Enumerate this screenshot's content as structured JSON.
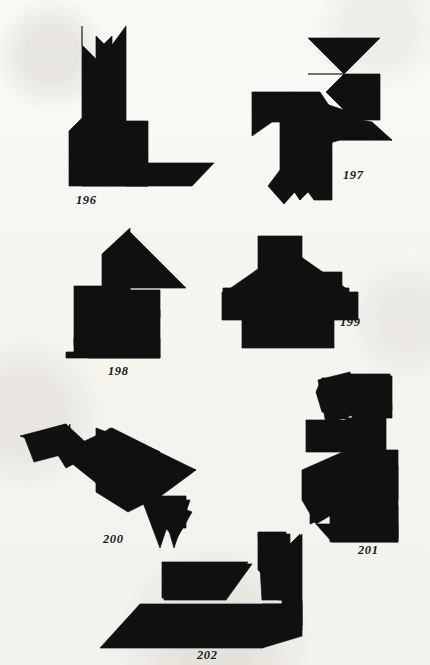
{
  "page": {
    "background_color": "#f7f6f2",
    "ink_color": "#111010",
    "width": 430,
    "height": 665,
    "figure_count": 7
  },
  "figures": [
    {
      "id": "figure-196",
      "caption": "196",
      "subject": "seated cat / rabbit silhouette",
      "caption_x": 76,
      "caption_y": 193,
      "polygons": [
        "82,26 82,75 104,97 104,44 96,36 96,59 82,45",
        "104,44 104,97 126,75 126,26 112,45 112,36 104,44",
        "82,75 82,103 104,125 126,103 126,75 104,97",
        "82,103 82,118 69,131 69,160 82,173 82,186 104,186 104,143 126,121 126,103 104,125",
        "104,143 104,186 126,186 148,164 148,121 126,121",
        "69,160 69,186 104,186 104,173 82,173",
        "104,186 148,186 170,164 148,164",
        "126,163 148,163 148,186 126,186",
        "148,163 214,163 192,186 126,186 148,163"
      ]
    },
    {
      "id": "figure-197",
      "caption": "197",
      "subject": "rooster / bird silhouette",
      "caption_x": 343,
      "caption_y": 168,
      "polygons": [
        "308,38 380,38 344,74 308,38",
        "308,74 380,74 380,110 344,74 308,74",
        "344,74 380,110 344,110 326,92 344,74",
        "290,92 344,110 380,110 380,120 326,120 290,92",
        "252,92 320,92 340,122 272,122 252,92",
        "252,92 272,122 252,136 252,92",
        "300,108 372,122 392,140 300,140 300,108",
        "300,120 392,140 340,140 300,152 300,120",
        "280,118 330,118 330,170 300,200 280,170 280,118",
        "280,170 300,200 320,170 320,200 300,186 284,204 268,186 280,170",
        "292,140 332,140 332,200 314,200 292,170 292,140"
      ]
    },
    {
      "id": "figure-198",
      "caption": "198",
      "subject": "rabbit / upright animal silhouette",
      "caption_x": 108,
      "caption_y": 364,
      "polygons": [
        "128,230 128,288 186,288 128,230",
        "102,254 130,228 130,290 102,290 102,254",
        "74,286 130,286 130,310 102,338 74,310 74,286",
        "102,290 160,290 160,318 132,318 102,290",
        "74,310 130,310 130,352 74,352 74,310",
        "130,310 160,310 160,352 130,352 130,310",
        "74,338 160,338 160,358 88,358 74,346 74,338",
        "66,352 160,352 160,358 66,358 66,352"
      ]
    },
    {
      "id": "figure-199",
      "caption": "199",
      "subject": "house silhouette",
      "caption_x": 340,
      "caption_y": 315,
      "polygons": [
        "258,236 302,236 302,292 258,292 258,236",
        "228,290 288,248 348,290 228,290",
        "288,248 348,290 288,290 288,248",
        "282,272 342,272 342,292 282,292 282,272",
        "223,288 349,288 349,298 223,298 223,288",
        "242,292 334,292 334,348 242,348 242,292",
        "334,292 358,292 358,320 334,320 334,292",
        "222,292 248,292 248,320 222,320 222,292"
      ]
    },
    {
      "id": "figure-200",
      "caption": "200",
      "subject": "bird / duck silhouette",
      "caption_x": 103,
      "caption_y": 532,
      "polygons": [
        "20,436 66,424 66,452 20,436",
        "24,436 66,424 72,452 34,462 24,436",
        "56,452 70,424 70,462 56,452",
        "66,424 96,452 66,468 56,452 66,424",
        "62,452 112,428 160,452 110,478 62,452",
        "96,428 160,452 128,484 96,452 96,428",
        "110,428 196,470 110,494 70,462 110,428",
        "110,446 196,470 150,504 96,478 110,446",
        "96,470 160,496 128,512 96,492 96,470",
        "140,496 186,496 186,528 156,528 140,496",
        "142,500 176,500 160,548 142,500",
        "160,500 190,500 174,548 160,500",
        "152,496 192,512 176,540 152,512 152,496"
      ]
    },
    {
      "id": "figure-201",
      "caption": "201",
      "subject": "rabbit silhouette",
      "caption_x": 358,
      "caption_y": 543,
      "polygons": [
        "322,378 348,378 348,420 322,412 316,392 322,378",
        "318,380 350,372 356,414 326,424 318,380",
        "350,374 390,374 392,410 354,420 350,374",
        "352,376 392,376 392,418 352,418 352,376",
        "306,420 352,420 352,452 306,452 306,420",
        "348,418 386,418 386,462 348,462 348,418",
        "348,450 398,450 398,500 362,500 348,472 348,450",
        "302,470 370,440 370,492 316,524 302,500 302,470",
        "310,470 366,440 366,500 310,524 310,470",
        "340,466 398,466 398,538 340,538 340,466",
        "316,524 398,524 398,542 332,542 316,524",
        "330,506 398,506 398,542 330,542 330,506"
      ]
    },
    {
      "id": "figure-202",
      "caption": "202",
      "subject": "reclining animal / sphinx silhouette",
      "caption_x": 197,
      "caption_y": 648,
      "polygons": [
        "258,532 286,532 286,596 258,570 258,532",
        "258,534 290,534 290,600 262,600 258,534",
        "162,562 248,562 222,598 162,598 162,562",
        "164,564 252,564 226,600 164,600 164,564",
        "278,556 300,534 300,600 278,600 278,556",
        "282,556 302,534 302,604 282,604 282,556",
        "140,604 262,604 302,604 302,626 262,648 100,648 140,604",
        "262,604 302,604 302,630 262,630 262,604",
        "262,626 302,600 302,636 262,648 262,626"
      ]
    }
  ]
}
